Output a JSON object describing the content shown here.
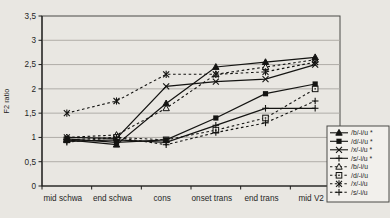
{
  "figure": {
    "bg": "#e9e7e2",
    "plot_bg": "#e9e7e2",
    "grid_color": "#a9a7a2",
    "border_color": "#4a4a46",
    "axis_color": "#1c1c1a",
    "series_color": "#141412",
    "legend_bg": "#f2f0ec",
    "text_color": "#1f1f1f"
  },
  "chart_data": {
    "type": "line",
    "title": "",
    "xlabel": "",
    "ylabel": "F2 ratio",
    "ylim": [
      0,
      3.5
    ],
    "ytick_step": 0.5,
    "ytick_labels": [
      "0",
      "0,5",
      "1",
      "1,5",
      "2",
      "2,5",
      "3",
      "3,5"
    ],
    "grid": true,
    "legend_position": "right-bottom",
    "categories": [
      "mid schwa",
      "end schwa",
      "cons",
      "onset trans",
      "end trans",
      "mid V2"
    ],
    "series": [
      {
        "name": "/b/-i/u *",
        "marker": "triangle-filled",
        "dash": false,
        "values": [
          0.95,
          0.85,
          1.7,
          2.45,
          2.55,
          2.65
        ]
      },
      {
        "name": "/d/-i/u *",
        "marker": "square-filled",
        "dash": false,
        "values": [
          0.97,
          0.9,
          0.95,
          1.4,
          1.9,
          2.1
        ]
      },
      {
        "name": "/x/-i/u *",
        "marker": "x",
        "dash": false,
        "values": [
          1.0,
          0.98,
          2.05,
          2.15,
          2.2,
          2.5
        ]
      },
      {
        "name": "/s/-i/u *",
        "marker": "plus",
        "dash": false,
        "values": [
          0.92,
          0.95,
          0.9,
          1.25,
          1.6,
          1.6
        ]
      },
      {
        "name": "/b/-i/u",
        "marker": "triangle-open",
        "dash": true,
        "values": [
          1.0,
          1.05,
          1.6,
          2.3,
          2.45,
          2.6
        ]
      },
      {
        "name": "/d/-i/u",
        "marker": "square-open",
        "dash": true,
        "values": [
          0.95,
          1.0,
          0.95,
          1.15,
          1.4,
          2.0
        ]
      },
      {
        "name": "/x/-i/u",
        "marker": "asterisk",
        "dash": true,
        "values": [
          1.5,
          1.75,
          2.3,
          2.3,
          2.35,
          2.55
        ]
      },
      {
        "name": "/s/-i/u",
        "marker": "plus",
        "dash": true,
        "values": [
          0.9,
          1.0,
          0.85,
          1.1,
          1.3,
          1.75
        ]
      }
    ]
  }
}
